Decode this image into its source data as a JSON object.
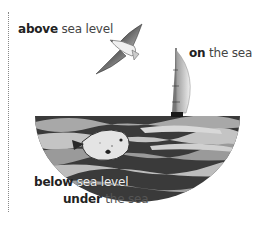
{
  "labels": {
    "above": {
      "bold": "above",
      "rest": " sea level"
    },
    "on": {
      "bold": "on",
      "rest": " the sea"
    },
    "below": {
      "bold": "below",
      "rest": " sea level"
    },
    "under": {
      "bold": "under",
      "rest": " the sea"
    }
  },
  "illustration": {
    "bird": "seagull-icon",
    "boat": "sailboat-icon",
    "fish": "fish-icon",
    "sea": "sea-waves"
  },
  "colors": {
    "wave_dark": "#3a3a3a",
    "wave_mid": "#8a8a8a",
    "wave_light": "#c8c8c8",
    "text": "#444444"
  }
}
